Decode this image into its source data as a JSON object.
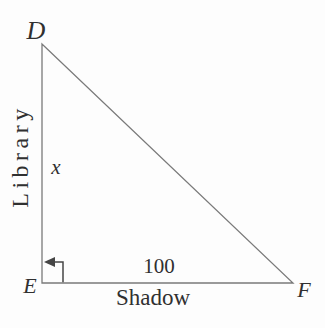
{
  "figure": {
    "vertex_labels": {
      "top": "D",
      "bottom_left": "E",
      "bottom_right": "F"
    },
    "side_labels": {
      "vertical_value": "x",
      "vertical_name": "Library",
      "horizontal_value": "100",
      "horizontal_name": "Shadow"
    },
    "colors": {
      "background": "#fdfdfd",
      "line": "#7a7a7a",
      "marker": "#454545",
      "text": "#303030"
    }
  }
}
